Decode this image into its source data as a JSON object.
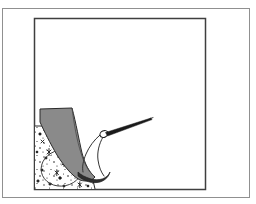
{
  "figure": {
    "title": "Line-art illustration of a boot on stippled ground probed by a needle instrument",
    "caption": "",
    "background_color": "#ffffff",
    "outer_border": {
      "name": "outer-border",
      "color": "#8d8d8d",
      "stroke_width": 1,
      "x": 2,
      "y": 8,
      "width": 248,
      "height": 190
    },
    "inner_frame": {
      "name": "inner-frame",
      "color": "#3f3f3f",
      "stroke_width": 1.4,
      "x": 34,
      "y": 18,
      "width": 172,
      "height": 172
    },
    "elements": [
      {
        "name": "ground-texture-patch",
        "type": "stipple-region",
        "description": "Speckled sandy ground wedge in lower-left of the inner frame",
        "fill": "#ffffff",
        "outline_color": "#2b2b2b",
        "speckle_color": "#1c1c1c"
      },
      {
        "name": "oval-outline",
        "type": "ellipse-outline",
        "description": "Faint oval drawn within the stippled ground",
        "stroke": "#3a3a3a"
      },
      {
        "name": "boot-shape",
        "type": "filled-polygon",
        "description": "Gray boot / foot form tapering to a toe at lower right",
        "fill": "#8a8a8a",
        "stroke": "#2a2a2a"
      },
      {
        "name": "boot-sole",
        "type": "filled-curve",
        "description": "Dark sole curve beneath the toe of the boot",
        "fill": "#2e2e2e"
      },
      {
        "name": "needle-probe",
        "type": "line-instrument",
        "description": "Slender pointed needle angled down-left toward the boot",
        "stroke": "#1a1a1a"
      },
      {
        "name": "needle-eye-loop",
        "type": "small-loop",
        "description": "Small loop or eye at the base of the needle",
        "stroke": "#1a1a1a"
      },
      {
        "name": "tether-curves",
        "type": "curved-lines",
        "description": "Two curved lines running from the needle eye down toward the boot",
        "stroke": "#333333"
      }
    ]
  }
}
